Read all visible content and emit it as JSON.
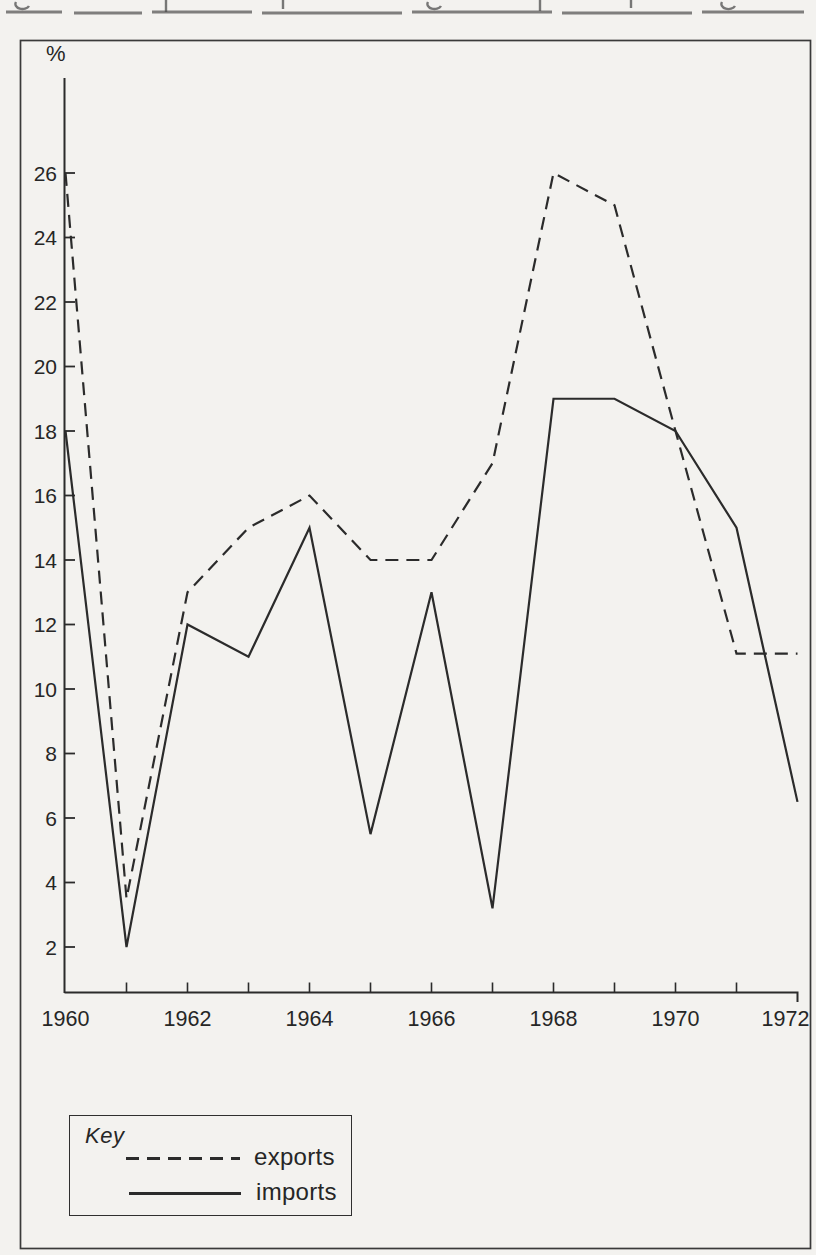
{
  "figure": {
    "y_axis_unit_label": "%",
    "y_ticks": [
      26,
      24,
      22,
      20,
      18,
      16,
      14,
      12,
      10,
      8,
      6,
      4,
      2
    ],
    "x_tick_labels": [
      "1960",
      "1962",
      "1964",
      "1966",
      "1968",
      "1970",
      "1972"
    ]
  },
  "legend": {
    "title": "Key",
    "items": [
      {
        "label": "exports",
        "style": "dashed"
      },
      {
        "label": "imports",
        "style": "solid"
      }
    ]
  },
  "chart_data": {
    "type": "line",
    "x": [
      1960,
      1961,
      1962,
      1963,
      1964,
      1965,
      1966,
      1967,
      1968,
      1969,
      1970,
      1971,
      1972
    ],
    "series": [
      {
        "name": "exports",
        "style": "dashed",
        "values": [
          26,
          3.5,
          13,
          15,
          16,
          14,
          14,
          17,
          26,
          25,
          18,
          11.1,
          11.1
        ]
      },
      {
        "name": "imports",
        "style": "solid",
        "values": [
          18,
          2,
          12,
          11,
          15,
          5.5,
          13,
          3.2,
          19,
          19,
          18,
          15,
          6.5
        ]
      }
    ],
    "title": "",
    "xlabel": "",
    "ylabel": "%",
    "ylim": [
      0,
      29
    ],
    "ytick_range": [
      2,
      26
    ],
    "xlim": [
      1960,
      1972
    ],
    "grid": false,
    "legend_position": "boxed key, bottom-left"
  },
  "colors": {
    "ink": "#2b2b2b",
    "paper": "#f3f2ef",
    "frame": "#3a3a3a"
  }
}
